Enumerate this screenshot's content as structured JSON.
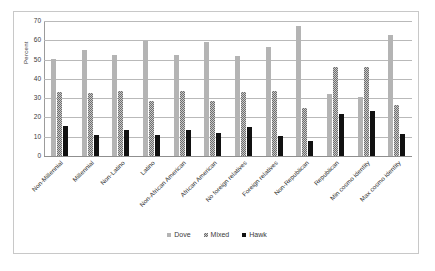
{
  "chart_data": {
    "type": "bar",
    "title": "",
    "xlabel": "",
    "ylabel": "Percent",
    "ylim": [
      0,
      70
    ],
    "yticks": [
      0,
      10,
      20,
      30,
      40,
      50,
      60,
      70
    ],
    "grid": true,
    "legend_position": "bottom",
    "categories": [
      "Non-Millennial",
      "Millennial",
      "Non-Latino",
      "Latino",
      "Non-African American",
      "African American",
      "No foreign relatives",
      "Foreign relatives",
      "Non-Republican",
      "Republican",
      "Min cosmo identity",
      "Max cosmo identity"
    ],
    "series": [
      {
        "name": "Dove",
        "color": "#b4b4b4",
        "values": [
          50.5,
          55,
          52.5,
          59.5,
          52.5,
          59,
          52,
          56.5,
          67.5,
          32,
          30.5,
          62.5
        ]
      },
      {
        "name": "Mixed",
        "color": "#c9c9c9",
        "values": [
          33,
          32.5,
          33.5,
          28.5,
          33.5,
          28.5,
          33,
          33.5,
          25,
          46,
          46,
          26.5
        ]
      },
      {
        "name": "Hawk",
        "color": "#111111",
        "values": [
          15.5,
          11,
          13.5,
          11,
          13.5,
          12,
          15,
          10.5,
          8,
          22,
          23.5,
          11.5
        ]
      }
    ]
  }
}
